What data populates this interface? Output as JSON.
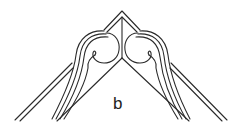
{
  "figure": {
    "label": "b",
    "stroke_color": "#2a2a2a",
    "background": "#ffffff"
  }
}
